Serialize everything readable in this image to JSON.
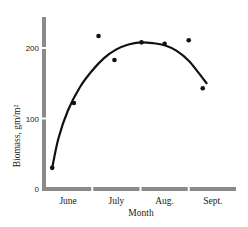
{
  "chart_data": {
    "type": "scatter",
    "title": "",
    "xlabel": "Month",
    "ylabel": "Biomass, gm/m²",
    "x_categories": [
      "June",
      "July",
      "Aug.",
      "Sept."
    ],
    "xlim": [
      0,
      4
    ],
    "ylim": [
      0,
      250
    ],
    "yticks": [
      0,
      100,
      200
    ],
    "ytick_labels": [
      "0",
      "100",
      "200"
    ],
    "grid": false,
    "legend": "none",
    "axis_color": "#8a8a8a",
    "series": [
      {
        "name": "observed",
        "kind": "points",
        "color": "#111111",
        "x": [
          0.17,
          0.62,
          1.13,
          1.46,
          2.02,
          2.5,
          3.0,
          3.29
        ],
        "y": [
          30,
          122,
          217,
          183,
          208,
          206,
          211,
          143
        ]
      },
      {
        "name": "fitted curve",
        "kind": "line",
        "color": "#111111",
        "x": [
          0.17,
          0.3,
          0.5,
          0.75,
          1.0,
          1.25,
          1.5,
          1.75,
          2.0,
          2.25,
          2.5,
          2.75,
          3.0,
          3.2,
          3.37
        ],
        "y": [
          30,
          72,
          112,
          145,
          168,
          186,
          198,
          205,
          208,
          207,
          204,
          196,
          182,
          165,
          150
        ]
      }
    ]
  }
}
